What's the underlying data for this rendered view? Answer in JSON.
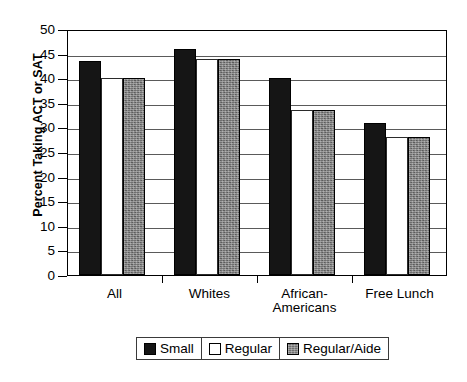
{
  "chart_data": {
    "type": "bar",
    "title": "",
    "xlabel": "",
    "ylabel": "Percent Taking ACT or SAT",
    "ylim": [
      0,
      50
    ],
    "ytick_step": 5,
    "yticks": [
      "50",
      "45",
      "40",
      "35",
      "30",
      "25",
      "20",
      "15",
      "10",
      "5",
      "0"
    ],
    "grid": true,
    "legend_position": "bottom",
    "categories": [
      "All",
      "Whites",
      "African-Americans",
      "Free Lunch"
    ],
    "category_labels": [
      {
        "line1": "All",
        "line2": ""
      },
      {
        "line1": "Whites",
        "line2": ""
      },
      {
        "line1": "African-",
        "line2": "Americans"
      },
      {
        "line1": "Free Lunch",
        "line2": ""
      }
    ],
    "series": [
      {
        "name": "Small",
        "color": "#151515",
        "values": [
          43.5,
          46.0,
          40.0,
          30.8
        ]
      },
      {
        "name": "Regular",
        "color": "#ffffff",
        "values": [
          40.0,
          44.0,
          33.5,
          28.0
        ]
      },
      {
        "name": "Regular/Aide",
        "color": "#6f6f6f",
        "values": [
          40.0,
          44.0,
          33.5,
          28.0
        ]
      }
    ]
  },
  "legend": {
    "items": [
      {
        "label": "Small",
        "swatch": "black-filled-swatch"
      },
      {
        "label": "Regular",
        "swatch": "white-outline-swatch"
      },
      {
        "label": "Regular/Aide",
        "swatch": "gray-textured-swatch"
      }
    ]
  }
}
